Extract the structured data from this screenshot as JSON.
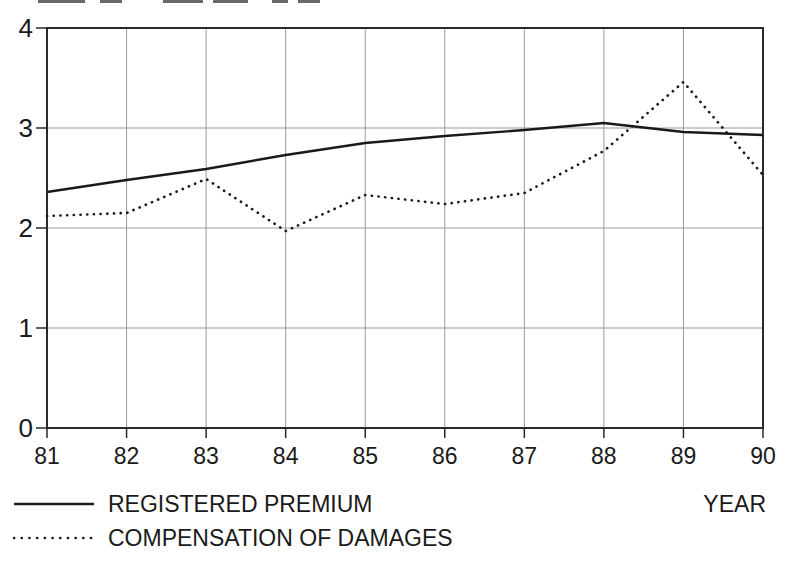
{
  "chart_data": {
    "type": "line",
    "title": "",
    "categories": [
      "81",
      "82",
      "83",
      "84",
      "85",
      "86",
      "87",
      "88",
      "89",
      "90"
    ],
    "x_axis_label": "YEAR",
    "ylabel": "",
    "ylim": [
      0,
      4
    ],
    "y_ticks": [
      "0",
      "1",
      "2",
      "3",
      "4"
    ],
    "grid": "on",
    "legend_position": "below-plot-left",
    "series": [
      {
        "name": "REGISTERED PREMIUM",
        "line_style": "solid",
        "values": [
          2.36,
          2.48,
          2.59,
          2.73,
          2.85,
          2.92,
          2.98,
          3.05,
          2.96,
          2.93
        ]
      },
      {
        "name": "COMPENSATION OF DAMAGES",
        "line_style": "dotted",
        "values": [
          2.12,
          2.15,
          2.49,
          1.97,
          2.33,
          2.24,
          2.35,
          2.77,
          3.46,
          2.53
        ]
      }
    ]
  },
  "colors": {
    "line": "#1a1a1a",
    "grid": "#9a9a9a",
    "border": "#2a2a2a",
    "text": "#1a1a1a",
    "background": "#ffffff"
  },
  "artifacts": {
    "cropped_title_fragments": [
      [
        38,
        47
      ],
      [
        100,
        22
      ],
      [
        163,
        40
      ],
      [
        213,
        35
      ],
      [
        272,
        16
      ],
      [
        298,
        22
      ]
    ]
  }
}
